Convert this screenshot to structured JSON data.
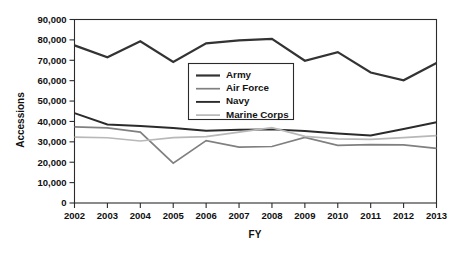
{
  "chart_data": {
    "type": "line",
    "title": "",
    "xlabel": "FY",
    "ylabel": "Accessions",
    "categories": [
      "2002",
      "2003",
      "2004",
      "2005",
      "2006",
      "2007",
      "2008",
      "2009",
      "2010",
      "2011",
      "2012",
      "2013"
    ],
    "x": [
      2002,
      2003,
      2004,
      2005,
      2006,
      2007,
      2008,
      2009,
      2010,
      2011,
      2012,
      2013
    ],
    "xlim": [
      2002,
      2013
    ],
    "ylim": [
      0,
      90000
    ],
    "ytick_labels": [
      "0",
      "10,000",
      "20,000",
      "30,000",
      "40,000",
      "50,000",
      "60,000",
      "70,000",
      "80,000",
      "90,000"
    ],
    "ytick_values": [
      0,
      10000,
      20000,
      30000,
      40000,
      50000,
      60000,
      70000,
      80000,
      90000
    ],
    "grid": false,
    "legend_position": "inside-upper-center",
    "series": [
      {
        "name": "Army",
        "color": "#333333",
        "width": 2.2,
        "values": [
          77300,
          71500,
          79300,
          69200,
          78300,
          79800,
          80500,
          69800,
          74000,
          64000,
          60200,
          68700
        ]
      },
      {
        "name": "Air Force",
        "color": "#808080",
        "width": 1.7,
        "values": [
          37300,
          36800,
          34800,
          19500,
          30600,
          27400,
          27700,
          32200,
          28300,
          28600,
          28500,
          26800
        ]
      },
      {
        "name": "Navy",
        "color": "#2b2b2b",
        "width": 1.9,
        "values": [
          44100,
          38500,
          37800,
          36800,
          35400,
          35900,
          36100,
          35300,
          34100,
          33100,
          36300,
          39600
        ]
      },
      {
        "name": "Marine Corps",
        "color": "#b8b8b8",
        "width": 1.7,
        "values": [
          32300,
          32000,
          30400,
          32100,
          32600,
          34800,
          37000,
          32700,
          31500,
          31200,
          32100,
          33000
        ]
      }
    ]
  },
  "axes": {
    "y_title": "Accessions",
    "x_title": "FY"
  },
  "legend": {
    "entries": [
      {
        "label": "Army"
      },
      {
        "label": "Air Force"
      },
      {
        "label": "Navy"
      },
      {
        "label": "Marine Corps"
      }
    ]
  }
}
